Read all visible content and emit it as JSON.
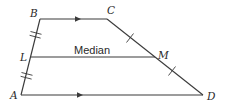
{
  "diagram": {
    "type": "trapezoid-median",
    "stroke_color": "#3a3a3a",
    "text_color": "#2a2a2a",
    "vertices": {
      "A": {
        "label": "A",
        "x": 21,
        "y": 95
      },
      "B": {
        "label": "B",
        "x": 40,
        "y": 19
      },
      "C": {
        "label": "C",
        "x": 107,
        "y": 19
      },
      "D": {
        "label": "D",
        "x": 203,
        "y": 95
      },
      "L": {
        "label": "L",
        "x": 31,
        "y": 57
      },
      "M": {
        "label": "M",
        "x": 155,
        "y": 57
      }
    },
    "segments": [
      {
        "from": "B",
        "to": "C",
        "marking": "parallel-arrow"
      },
      {
        "from": "A",
        "to": "D",
        "marking": "parallel-arrow"
      },
      {
        "from": "B",
        "to": "L",
        "marking": "double-tick"
      },
      {
        "from": "L",
        "to": "A",
        "marking": "double-tick"
      },
      {
        "from": "C",
        "to": "M",
        "marking": "single-tick"
      },
      {
        "from": "M",
        "to": "D",
        "marking": "single-tick"
      },
      {
        "from": "L",
        "to": "M",
        "marking": "none",
        "label": "Median"
      }
    ],
    "median_label": "Median"
  }
}
